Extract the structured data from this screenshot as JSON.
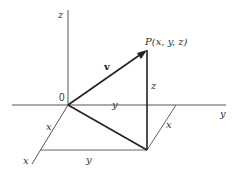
{
  "diagram": {
    "labels": {
      "z_axis": "z",
      "y_axis": "y",
      "x_axis": "x",
      "origin": "0",
      "point": "P(x, y, z)",
      "vector": "v",
      "z_component": "z",
      "y_component_top": "y",
      "y_component_bottom": "y",
      "x_component_left": "x",
      "x_component_right": "x"
    },
    "colors": {
      "axis": "#555555",
      "vector": "#222222",
      "guide": "#666666"
    }
  }
}
